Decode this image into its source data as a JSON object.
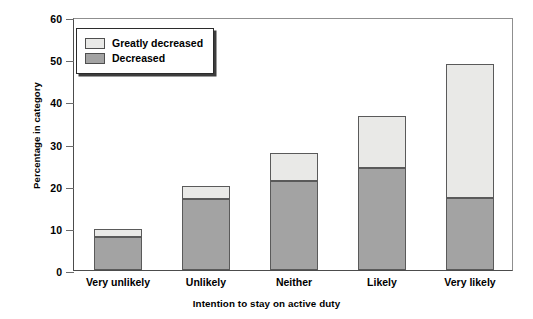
{
  "chart_data": {
    "type": "bar",
    "subtype": "stacked",
    "title": "",
    "xlabel": "Intention to stay on active duty",
    "ylabel": "Percentage in category",
    "categories": [
      "Very unlikely",
      "Unlikely",
      "Neither",
      "Likely",
      "Very likely"
    ],
    "series": [
      {
        "name": "Decreased",
        "color": "#a3a3a3",
        "values": [
          7.9,
          16.9,
          21.0,
          24.3,
          17.0
        ]
      },
      {
        "name": "Greatly decreased",
        "color": "#e9e9e7",
        "values": [
          1.6,
          2.9,
          6.5,
          12.0,
          31.7
        ]
      }
    ],
    "totals": [
      9.5,
      19.8,
      27.5,
      36.3,
      48.7
    ],
    "ylim": [
      0,
      60
    ],
    "yticks": [
      0,
      10,
      20,
      30,
      40,
      50,
      60
    ],
    "ytick_labels": [
      "0",
      "10",
      "20",
      "30",
      "40",
      "50",
      "60"
    ],
    "grid": false,
    "legend_position": "top-left",
    "legend_entries": [
      "Greatly decreased",
      "Decreased"
    ]
  },
  "legend": {
    "items": [
      {
        "label": "Greatly decreased",
        "swatch": "#e9e9e7"
      },
      {
        "label": "Decreased",
        "swatch": "#a3a3a3"
      }
    ]
  },
  "axes": {
    "y_title": "Percentage in category",
    "x_title": "Intention to stay on active duty",
    "y_ticks": [
      "0",
      "10",
      "20",
      "30",
      "40",
      "50",
      "60"
    ],
    "x_ticks": [
      "Very unlikely",
      "Unlikely",
      "Neither",
      "Likely",
      "Very likely"
    ]
  }
}
